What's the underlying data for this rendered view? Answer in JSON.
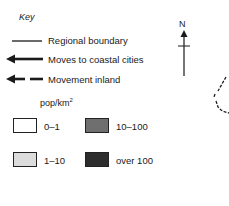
{
  "key": {
    "title": "Key",
    "lines": [
      {
        "label": "Regional boundary",
        "style": "thin-solid-line"
      },
      {
        "label": "Moves to coastal cities",
        "style": "solid-arrow"
      },
      {
        "label": "Movement inland",
        "style": "dashed-arrow"
      }
    ],
    "density_unit": "pop/km",
    "density_unit_exponent": "2",
    "density_classes": [
      {
        "label": "0–1",
        "fill": "#ffffff"
      },
      {
        "label": "10–100",
        "fill": "#a8a8a8"
      },
      {
        "label": "1–10",
        "fill": "#dcdcdc"
      },
      {
        "label": "over 100",
        "fill": "#555555"
      }
    ]
  },
  "north_arrow": {
    "label": "N"
  }
}
